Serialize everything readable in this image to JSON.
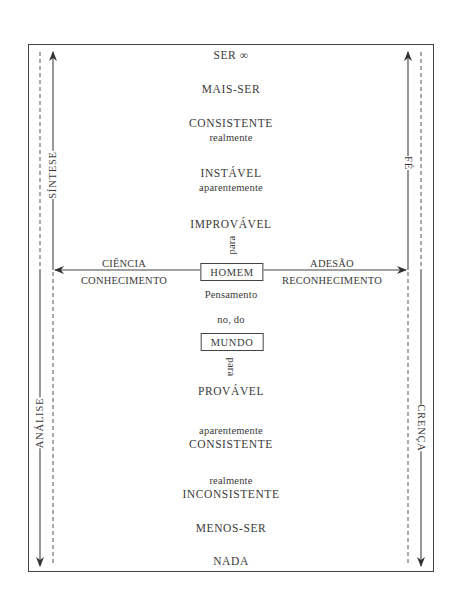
{
  "diagram": {
    "ladder_top": [
      {
        "id": "ser",
        "text": "SER ∞"
      },
      {
        "id": "mais_ser",
        "text": "MAIS-SER"
      },
      {
        "id": "consistente_top",
        "text": "CONSISTENTE",
        "sub": "realmente"
      },
      {
        "id": "instavel",
        "text": "INSTÁVEL",
        "sub": "aparentemente"
      },
      {
        "id": "improvavel",
        "text": "IMPROVÁVEL"
      }
    ],
    "para_up": "para",
    "center": {
      "homem": "HOMEM",
      "pensamento": "Pensamento",
      "no_do": "no, do",
      "mundo": "MUNDO"
    },
    "para_down": "para",
    "ladder_bottom": [
      {
        "id": "provavel",
        "text": "PROVÁVEL"
      },
      {
        "id": "consistente_bottom",
        "pre": "aparentemente",
        "text": "CONSISTENTE"
      },
      {
        "id": "inconsistente",
        "pre": "realmente",
        "text": "INCONSISTENTE"
      },
      {
        "id": "menos_ser",
        "text": "MENOS-SER"
      },
      {
        "id": "nada",
        "text": "NADA"
      }
    ],
    "left_arrow": {
      "top": "CIÊNCIA",
      "bottom": "CONHECIMENTO"
    },
    "right_arrow": {
      "top": "ADESÃO",
      "bottom": "RECONHECIMENTO"
    },
    "side_labels": {
      "left_up": "SÍNTESE",
      "left_down": "ANÁLISE",
      "right_up": "FÉ",
      "right_down": "CRENÇA"
    },
    "colors": {
      "line": "#444444",
      "text": "#3a3a3a",
      "background": "#ffffff"
    }
  }
}
